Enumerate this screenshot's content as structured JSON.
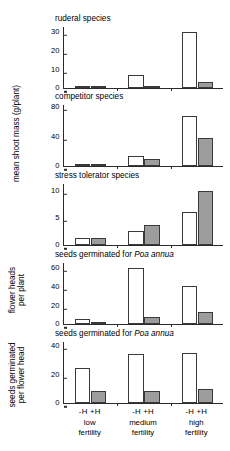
{
  "figure": {
    "groups": [
      "low fertility",
      "medium fertility",
      "high fertility"
    ],
    "treatments": [
      "-H",
      "+H"
    ],
    "treatment_labels": {
      "minus": "-H",
      "plus": "+H"
    },
    "group_lines": [
      {
        "line1": "low",
        "line2": "fertility"
      },
      {
        "line1": "medium",
        "line2": "fertility"
      },
      {
        "line1": "high",
        "line2": "fertility"
      }
    ],
    "colors": {
      "open_bar": "#ffffff",
      "filled_bar": "#9d9d9d",
      "axis": "#2b2b2b",
      "text": "#000000"
    }
  },
  "chart_data": [
    {
      "type": "bar",
      "title": "ruderal species",
      "ylabel": "mean shoot mass (g/plant)",
      "xlabel": "",
      "categories": [
        "low fertility",
        "medium fertility",
        "high fertility"
      ],
      "ylim": [
        0,
        33
      ],
      "yticks": [
        0,
        10,
        20,
        30
      ],
      "grid": false,
      "legend": "none",
      "series": [
        {
          "name": "-H",
          "values": [
            1.3,
            7.0,
            30.0
          ]
        },
        {
          "name": "+H",
          "values": [
            0.3,
            0.8,
            3.1
          ]
        }
      ]
    },
    {
      "type": "bar",
      "title": "competitor species",
      "ylabel": "mean shoot mass (g/plant)",
      "xlabel": "",
      "categories": [
        "low fertility",
        "medium fertility",
        "high fertility"
      ],
      "ylim": [
        0,
        84
      ],
      "yticks": [
        0,
        40,
        80
      ],
      "grid": false,
      "legend": "none",
      "series": [
        {
          "name": "-H",
          "values": [
            2.2,
            13.0,
            68.0
          ]
        },
        {
          "name": "+H",
          "values": [
            2.0,
            9.0,
            38.0
          ]
        }
      ]
    },
    {
      "type": "bar",
      "title": "stress tolerator species",
      "ylabel": "mean shoot mass (g/plant)",
      "xlabel": "",
      "categories": [
        "low fertility",
        "medium fertility",
        "high fertility"
      ],
      "ylim": [
        0,
        11.4
      ],
      "yticks": [
        0,
        5,
        10
      ],
      "grid": false,
      "legend": "none",
      "series": [
        {
          "name": "-H",
          "values": [
            1.3,
            2.6,
            6.1
          ]
        },
        {
          "name": "+H",
          "values": [
            1.2,
            3.6,
            10.0
          ]
        }
      ]
    },
    {
      "type": "bar",
      "title_prefix": "seeds germinated for ",
      "title_italic": "Poa annua",
      "title": "seeds germinated for Poa annua",
      "ylabel_line1": "flower heads",
      "ylabel_line2": "per plant",
      "ylabel": "flower heads per plant",
      "xlabel": "",
      "categories": [
        "low fertility",
        "medium fertility",
        "high fertility"
      ],
      "ylim": [
        0,
        66
      ],
      "yticks": [
        0,
        20,
        40,
        60
      ],
      "grid": false,
      "legend": "none",
      "series": [
        {
          "name": "-H",
          "values": [
            5.0,
            60.0,
            41.0
          ]
        },
        {
          "name": "+H",
          "values": [
            1.5,
            8.0,
            13.0
          ]
        }
      ]
    },
    {
      "type": "bar",
      "title_prefix": "seeds germinated for ",
      "title_italic": "Poa annua",
      "title": "seeds germinated for Poa annua",
      "ylabel_line1": "seeds germinated",
      "ylabel_line2": "per flower head",
      "ylabel": "seeds germinated per flower head",
      "xlabel": "",
      "categories": [
        "low fertility",
        "medium fertility",
        "high fertility"
      ],
      "ylim": [
        0,
        43
      ],
      "yticks": [
        0,
        20,
        40
      ],
      "grid": false,
      "legend": "none",
      "series": [
        {
          "name": "-H",
          "values": [
            24.5,
            34.0,
            35.0
          ]
        },
        {
          "name": "+H",
          "values": [
            8.0,
            8.5,
            9.5
          ]
        }
      ]
    }
  ]
}
